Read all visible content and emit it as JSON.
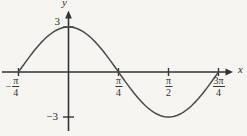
{
  "chart_data": {
    "type": "line",
    "title": "",
    "xlabel": "x",
    "ylabel": "y",
    "grid": false,
    "legend": false,
    "amplitude": 3,
    "frequency": 2,
    "x_range_radians": [
      -0.7853981633974483,
      2.356194490192345
    ],
    "ylim": [
      -3,
      3
    ],
    "points": [
      {
        "x": "-π/4",
        "y": 0
      },
      {
        "x": "0",
        "y": 3
      },
      {
        "x": "π/4",
        "y": 0
      },
      {
        "x": "π/2",
        "y": -3
      },
      {
        "x": "3π/4",
        "y": 0
      }
    ],
    "x_ticks": [
      {
        "value_radians": -0.7853981633974483,
        "label": "-π/4",
        "minus": "−",
        "num": "π",
        "den": "4"
      },
      {
        "value_radians": 0.7853981633974483,
        "label": "π/4",
        "minus": "",
        "num": "π",
        "den": "4"
      },
      {
        "value_radians": 1.5707963267948966,
        "label": "π/2",
        "minus": "",
        "num": "π",
        "den": "2"
      },
      {
        "value_radians": 2.356194490192345,
        "label": "3π/4",
        "minus": "",
        "num": "3π",
        "den": "4"
      }
    ],
    "y_ticks": [
      {
        "value": 3,
        "label": "3"
      },
      {
        "value": -3,
        "label": "−3"
      }
    ],
    "axis_color": "#333333",
    "curve_color": "#4a4a4a",
    "background": "#f6f5f1"
  }
}
